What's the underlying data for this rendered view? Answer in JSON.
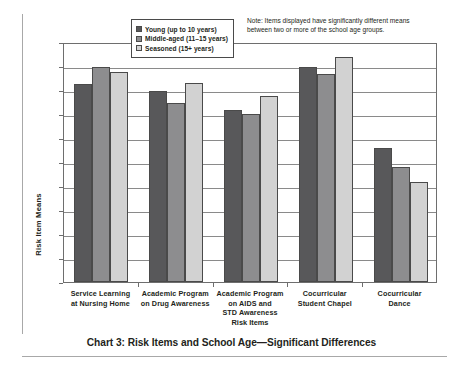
{
  "chart_data": {
    "type": "bar",
    "title": "Chart 3: Risk Items and School Age—Significant Differences",
    "xlabel": "Risk Items",
    "ylabel": "Risk Item Means",
    "ylim": [
      0,
      5
    ],
    "ytick_step": 0.5,
    "ytick_labels": [
      "5.000",
      "4.500",
      "4.000",
      "3.500",
      "3.000",
      "2.500",
      "2.000",
      "1.500",
      "1.000",
      "0.500",
      "0.000"
    ],
    "ytick_values": [
      5.0,
      4.5,
      4.0,
      3.5,
      3.0,
      2.5,
      2.0,
      1.5,
      1.0,
      0.5,
      0.0
    ],
    "grid": true,
    "legend_position": "top-center-inside",
    "categories": [
      "Service Learning at Nursing Home",
      "Academic Program on Drug Awareness",
      "Academic Program on AIDS and STD Awareness",
      "Cocurricular Student Chapel",
      "Cocurricular Dance"
    ],
    "category_lines": [
      [
        "Service Learning",
        "at Nursing Home"
      ],
      [
        "Academic Program",
        "on Drug Awareness"
      ],
      [
        "Academic Program",
        "on AIDS and",
        "STD Awareness"
      ],
      [
        "Cocurricular",
        "Student Chapel"
      ],
      [
        "Cocurricular",
        "Dance"
      ]
    ],
    "series": [
      {
        "name": "Young (up to 10 years)",
        "color": "#58585a",
        "values": [
          4.13,
          3.97,
          3.59,
          4.47,
          2.8
        ]
      },
      {
        "name": "Middle-aged (11–15 years)",
        "color": "#8d8d8f",
        "values": [
          4.48,
          3.73,
          3.49,
          4.33,
          2.39
        ]
      },
      {
        "name": "Seasoned (15+ years)",
        "color": "#d2d2d2",
        "values": [
          4.37,
          4.14,
          3.88,
          4.69,
          2.08
        ]
      }
    ],
    "annotations": [
      "Note: Items displayed have significantly different means between two or more of the school age groups."
    ]
  },
  "note": {
    "line1": "Note: Items displayed have significantly different means",
    "line2": "between two or more of the school age groups."
  },
  "colors": {
    "young": "#58585a",
    "middle_aged": "#8d8d8f",
    "seasoned": "#d2d2d2",
    "axis": "#6e6e6e",
    "grid": "#8a8a8a",
    "text": "#231f20"
  }
}
